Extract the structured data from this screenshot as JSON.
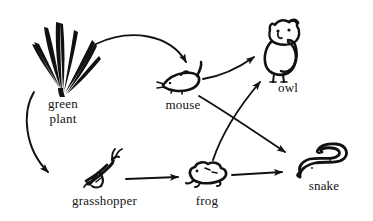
{
  "diagram": {
    "type": "food-web",
    "background_color": "#ffffff",
    "ink_color": "#111111",
    "nodes": [
      {
        "id": "green-plant",
        "label": "green\nplant",
        "icon": "grass-tuft-icon",
        "label_x": 33,
        "label_y": 96,
        "label_width": 60
      },
      {
        "id": "mouse",
        "label": "mouse",
        "icon": "mouse-icon",
        "label_x": 155,
        "label_y": 97,
        "label_width": 56
      },
      {
        "id": "owl",
        "label": "owl",
        "icon": "owl-icon",
        "label_x": 268,
        "label_y": 80,
        "label_width": 40
      },
      {
        "id": "grasshopper",
        "label": "grasshopper",
        "icon": "grasshopper-icon",
        "label_x": 52,
        "label_y": 193,
        "label_width": 105
      },
      {
        "id": "frog",
        "label": "frog",
        "icon": "frog-icon",
        "label_x": 185,
        "label_y": 193,
        "label_width": 44
      },
      {
        "id": "snake",
        "label": "snake",
        "icon": "snake-icon",
        "label_x": 297,
        "label_y": 178,
        "label_width": 54
      }
    ],
    "edges": [
      {
        "id": "plant-to-mouse",
        "from": "green-plant",
        "to": "mouse"
      },
      {
        "id": "plant-to-grasshopper",
        "from": "green-plant",
        "to": "grasshopper"
      },
      {
        "id": "mouse-to-owl",
        "from": "mouse",
        "to": "owl"
      },
      {
        "id": "mouse-to-snake",
        "from": "mouse",
        "to": "snake"
      },
      {
        "id": "grasshopper-to-frog",
        "from": "grasshopper",
        "to": "frog"
      },
      {
        "id": "frog-to-owl",
        "from": "frog",
        "to": "owl"
      },
      {
        "id": "frog-to-snake",
        "from": "frog",
        "to": "snake"
      }
    ]
  }
}
